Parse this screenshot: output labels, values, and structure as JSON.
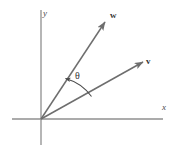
{
  "figure": {
    "kind": "vector-angle-diagram",
    "background_color": "#ffffff",
    "axis_color": "#8a8a8a",
    "vector_color": "#707070",
    "arc_color": "#4a4a4a",
    "text_color": "#333333",
    "axes": {
      "x_label": "x",
      "y_label": "y",
      "origin": {
        "x": 41,
        "y": 119
      },
      "x_axis": {
        "x1": 12,
        "y1": 119,
        "x2": 163,
        "y2": 119
      },
      "y_axis": {
        "x1": 41,
        "y1": 10,
        "x2": 41,
        "y2": 145
      }
    },
    "vectors": [
      {
        "name": "w",
        "label": "w",
        "tip": {
          "x": 106,
          "y": 21
        },
        "tail": {
          "x": 41,
          "y": 119
        },
        "label_pos": {
          "x": 110,
          "y": 11
        }
      },
      {
        "name": "v",
        "label": "v",
        "tip": {
          "x": 144,
          "y": 61
        },
        "tail": {
          "x": 41,
          "y": 119
        },
        "label_pos": {
          "x": 146,
          "y": 57
        }
      }
    ],
    "angle": {
      "label": "θ",
      "name": "theta",
      "arc_start": {
        "x": 64,
        "y": 77
      },
      "arc_end": {
        "x": 91,
        "y": 96
      },
      "arrow_at": "arc_start"
    }
  }
}
